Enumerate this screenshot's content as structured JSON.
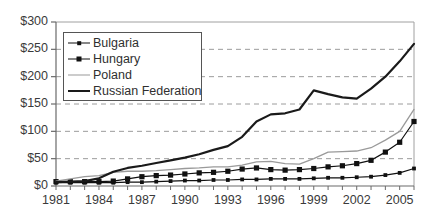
{
  "chart_data": {
    "type": "line",
    "title": "",
    "xlabel": "",
    "ylabel": "",
    "ylim": [
      0,
      300
    ],
    "ytick_values": [
      0,
      50,
      100,
      150,
      200,
      250,
      300
    ],
    "ytick_labels": [
      "$0",
      "$50",
      "$100",
      "$150",
      "$200",
      "$250",
      "$300"
    ],
    "grid": "horizontal-dashed",
    "legend_position": "upper-left-inside",
    "x": [
      1981,
      1982,
      1983,
      1984,
      1985,
      1986,
      1987,
      1988,
      1989,
      1990,
      1991,
      1992,
      1993,
      1994,
      1995,
      1996,
      1997,
      1998,
      1999,
      2000,
      2001,
      2002,
      2003,
      2004,
      2005,
      2006
    ],
    "xtick_labels": [
      "1981",
      "1984",
      "1987",
      "1990",
      "1993",
      "1996",
      "1999",
      "2002",
      "2005"
    ],
    "xtick_label_values": [
      1981,
      1984,
      1987,
      1990,
      1993,
      1996,
      1999,
      2002,
      2005
    ],
    "series": [
      {
        "name": "Bulgaria",
        "color": "#111111",
        "style": "solid-thin-marker",
        "marker": "small-square",
        "values": [
          6,
          6,
          6,
          6,
          6,
          7,
          7,
          8,
          9,
          10,
          10,
          11,
          11,
          12,
          12,
          13,
          13,
          13,
          14,
          15,
          15,
          16,
          17,
          20,
          24,
          32
        ]
      },
      {
        "name": "Hungary",
        "color": "#111111",
        "style": "solid-thin-marker",
        "marker": "square",
        "values": [
          8,
          8,
          8,
          8,
          9,
          13,
          17,
          19,
          20,
          22,
          24,
          25,
          27,
          31,
          33,
          30,
          29,
          30,
          32,
          35,
          37,
          41,
          47,
          62,
          80,
          118
        ]
      },
      {
        "name": "Poland",
        "color": "#9a9a9a",
        "style": "solid-thin",
        "marker": "none",
        "values": [
          9,
          13,
          17,
          19,
          25,
          27,
          27,
          28,
          30,
          32,
          33,
          35,
          35,
          38,
          44,
          45,
          41,
          40,
          50,
          62,
          63,
          64,
          70,
          84,
          100,
          140
        ]
      },
      {
        "name": "Russian Federation",
        "color": "#1a1a1a",
        "style": "solid-thick",
        "marker": "none",
        "values": [
          7,
          8,
          9,
          14,
          26,
          33,
          37,
          42,
          47,
          52,
          58,
          66,
          73,
          90,
          118,
          131,
          133,
          140,
          175,
          168,
          162,
          160,
          178,
          200,
          228,
          260
        ]
      }
    ]
  },
  "legend": {
    "items": [
      {
        "label": "Bulgaria",
        "key": "line-small-marker"
      },
      {
        "label": "Hungary",
        "key": "line-square-marker"
      },
      {
        "label": "Poland",
        "key": "line-gray-thin"
      },
      {
        "label": "Russian Federation",
        "key": "line-black-thick"
      }
    ]
  }
}
